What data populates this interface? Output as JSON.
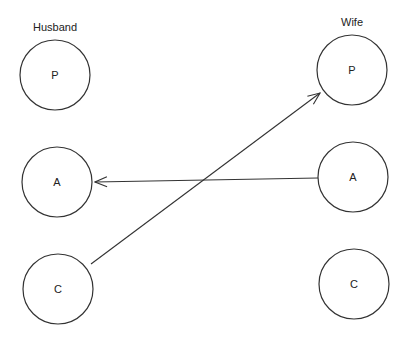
{
  "diagram": {
    "columns": [
      {
        "title": "Husband",
        "title_pos": [
          55,
          31
        ]
      },
      {
        "title": "Wife",
        "title_pos": [
          352,
          26
        ]
      }
    ],
    "nodes": [
      {
        "id": "husband-P",
        "label": "P",
        "cx": 55,
        "cy": 75,
        "r": 35
      },
      {
        "id": "husband-A",
        "label": "A",
        "cx": 57,
        "cy": 182,
        "r": 35
      },
      {
        "id": "husband-C",
        "label": "C",
        "cx": 58,
        "cy": 289,
        "r": 35
      },
      {
        "id": "wife-P",
        "label": "P",
        "cx": 352,
        "cy": 70,
        "r": 35
      },
      {
        "id": "wife-A",
        "label": "A",
        "cx": 353,
        "cy": 177,
        "r": 35
      },
      {
        "id": "wife-C",
        "label": "C",
        "cx": 354,
        "cy": 284,
        "r": 35
      }
    ],
    "edges": [
      {
        "from": "wife-A",
        "to": "husband-A",
        "x1": 318,
        "y1": 178,
        "x2": 95,
        "y2": 182
      },
      {
        "from": "husband-C",
        "to": "wife-P",
        "x1": 91,
        "y1": 264,
        "x2": 320,
        "y2": 93
      }
    ],
    "colors": {
      "stroke": "#333333",
      "text": "#222222",
      "background": "#ffffff"
    }
  }
}
